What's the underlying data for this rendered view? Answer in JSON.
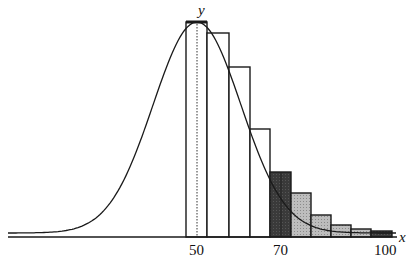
{
  "chart_data": {
    "type": "bar",
    "title": "",
    "xlabel": "x",
    "ylabel": "y",
    "x_ticks": [
      "50",
      "70",
      "100"
    ],
    "bars": [
      {
        "x0": 46,
        "x1": 52,
        "height": 1.0,
        "fill": "white",
        "note": "dotted center line at x=50"
      },
      {
        "x0": 52,
        "x1": 58,
        "height": 0.95,
        "fill": "white"
      },
      {
        "x0": 58,
        "x1": 64,
        "height": 0.79,
        "fill": "white"
      },
      {
        "x0": 64,
        "x1": 70,
        "height": 0.5,
        "fill": "white"
      },
      {
        "x0": 70,
        "x1": 76,
        "height": 0.3,
        "fill": "dark"
      },
      {
        "x0": 76,
        "x1": 82,
        "height": 0.21,
        "fill": "light"
      },
      {
        "x0": 82,
        "x1": 88,
        "height": 0.1,
        "fill": "light"
      },
      {
        "x0": 88,
        "x1": 94,
        "height": 0.05,
        "fill": "light"
      },
      {
        "x0": 94,
        "x1": 100,
        "height": 0.03,
        "fill": "light"
      },
      {
        "x0": 100,
        "x1": 106,
        "height": 0.02,
        "fill": "dark"
      }
    ],
    "curve": {
      "type": "normal",
      "mean": 50,
      "peak": 1.0
    },
    "grid": false,
    "legend": null
  },
  "labels": {
    "y_axis": "y",
    "x_axis": "x",
    "tick_50": "50",
    "tick_70": "70",
    "tick_100": "100"
  },
  "colors": {
    "stroke": "#1a1a1a",
    "dark_fill": "#3a3a3a",
    "light_fill": "#b4b4b4"
  }
}
